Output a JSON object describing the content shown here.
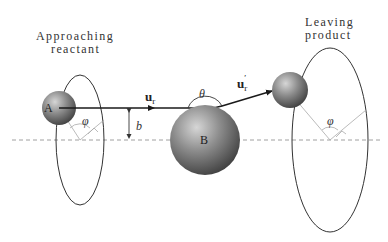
{
  "labels": {
    "approaching_line1": "Approaching",
    "approaching_line2": "reactant",
    "leaving_line1": "Leaving",
    "leaving_line2": "product",
    "atom_a": "A",
    "atom_b": "B",
    "vector_in": "u",
    "vector_in_sub": "r",
    "vector_out": "u",
    "vector_out_sub": "r",
    "vector_out_prime": "′",
    "theta": "θ",
    "impact_parameter": "b",
    "phi_left": "φ",
    "phi_right": "φ"
  },
  "colors": {
    "line": "#333333",
    "trajectory": "#1a1a1a",
    "dashed_axis": "#888888",
    "sphere_light": "#d0d0d0",
    "sphere_mid": "#8a8a8a",
    "sphere_dark": "#3c3c3c",
    "angle_lines": "#aaaaaa"
  }
}
